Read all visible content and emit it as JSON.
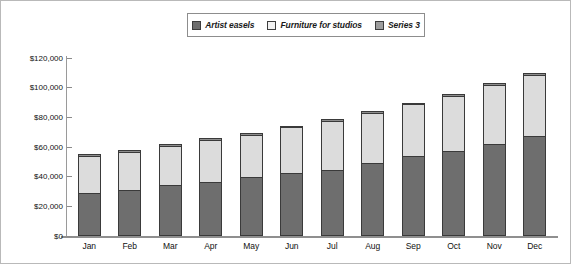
{
  "chart_data": {
    "type": "bar",
    "stacked": true,
    "title": "",
    "xlabel": "",
    "ylabel": "",
    "ylim": [
      0,
      120000
    ],
    "ytick_step": 20000,
    "ytick_labels": [
      "$120,000",
      "$100,000",
      "$80,000",
      "$60,000",
      "$40,000",
      "$20,000",
      "$0"
    ],
    "ytick_values": [
      120000,
      100000,
      80000,
      60000,
      40000,
      20000,
      0
    ],
    "grid": false,
    "legend_position": "top-center",
    "categories": [
      "Jan",
      "Feb",
      "Mar",
      "Apr",
      "May",
      "Jun",
      "Jul",
      "Aug",
      "Sep",
      "Oct",
      "Nov",
      "Dec"
    ],
    "series": [
      {
        "name": "Artist easels",
        "color": "#6e6e6e",
        "values": [
          28000,
          30500,
          33500,
          35500,
          39000,
          41500,
          44000,
          48500,
          53000,
          56500,
          61500,
          67000
        ]
      },
      {
        "name": "Furniture for studios",
        "color": "#dcdcdc",
        "values": [
          25000,
          25500,
          26500,
          28500,
          28500,
          31000,
          33000,
          34000,
          35000,
          37500,
          39500,
          41000
        ]
      },
      {
        "name": "Series 3",
        "color": "#8e8e8e",
        "values": [
          2000,
          2000,
          2000,
          2000,
          2000,
          2000,
          2000,
          2000,
          2000,
          2000,
          2000,
          2000
        ]
      }
    ],
    "totals": [
      55000,
      58000,
      62000,
      66000,
      69500,
      74500,
      79000,
      84500,
      90000,
      96000,
      103000,
      110000
    ]
  },
  "legend": {
    "items": [
      {
        "label": "Artist easels"
      },
      {
        "label": "Furniture for studios"
      },
      {
        "label": "Series 3"
      }
    ]
  }
}
